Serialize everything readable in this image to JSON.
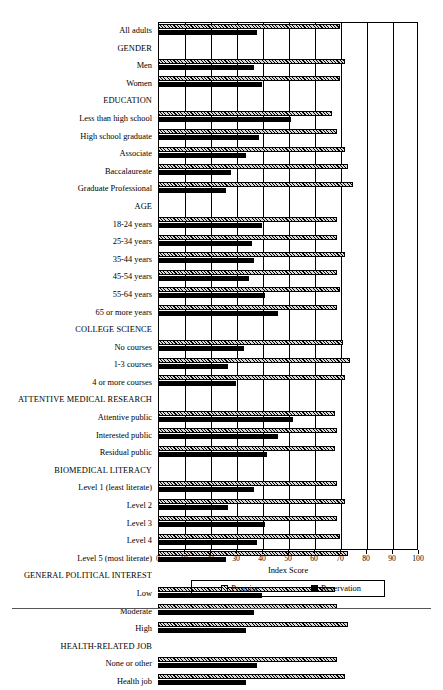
{
  "chart_data": {
    "type": "bar",
    "orientation": "horizontal",
    "title": "",
    "xlabel": "Index Score",
    "ylabel": "",
    "xlim": [
      0,
      100
    ],
    "xticks": [
      0,
      10,
      20,
      30,
      40,
      50,
      60,
      70,
      80,
      90,
      100
    ],
    "grid": "vertical",
    "legend_position": "bottom",
    "legend": [
      "Promise",
      "Reservation"
    ],
    "series": [
      {
        "name": "Promise",
        "pattern": "hatched"
      },
      {
        "name": "Reservation",
        "pattern": "solid-black"
      }
    ],
    "categories": [
      "All adults",
      "GENDER",
      "Men",
      "Women",
      "EDUCATION",
      "Less than high school",
      "High school graduate",
      "Associate",
      "Baccalaureate",
      "Graduate Professional",
      "AGE",
      "18-24 years",
      "25-34 years",
      "35-44 years",
      "45-54 years",
      "55-64 years",
      "65 or more years",
      "COLLEGE SCIENCE",
      "No courses",
      "1-3 courses",
      "4 or more courses",
      "ATTENTIVE MEDICAL RESEARCH",
      "Attentive public",
      "Interested public",
      "Residual public",
      "BIOMEDICAL LITERACY",
      "Level 1 (least literate)",
      "Level 2",
      "Level 3",
      "Level 4",
      "Level 5 (most literate)",
      "GENERAL POLITICAL INTEREST",
      "Low",
      "Moderate",
      "High",
      "HEALTH-RELATED JOB",
      "None or other",
      "Health job"
    ],
    "rows": [
      {
        "label": "All adults",
        "header": false,
        "promise": 70,
        "reservation": 38
      },
      {
        "label": "GENDER",
        "header": true,
        "promise": null,
        "reservation": null
      },
      {
        "label": "Men",
        "header": false,
        "promise": 72,
        "reservation": 37
      },
      {
        "label": "Women",
        "header": false,
        "promise": 70,
        "reservation": 40
      },
      {
        "label": "EDUCATION",
        "header": true,
        "promise": null,
        "reservation": null
      },
      {
        "label": "Less than high school",
        "header": false,
        "promise": 67,
        "reservation": 51
      },
      {
        "label": "High school graduate",
        "header": false,
        "promise": 69,
        "reservation": 39
      },
      {
        "label": "Associate",
        "header": false,
        "promise": 72,
        "reservation": 34
      },
      {
        "label": "Baccalaureate",
        "header": false,
        "promise": 73,
        "reservation": 28
      },
      {
        "label": "Graduate Professional",
        "header": false,
        "promise": 75,
        "reservation": 26
      },
      {
        "label": "AGE",
        "header": true,
        "promise": null,
        "reservation": null
      },
      {
        "label": "18-24 years",
        "header": false,
        "promise": 69,
        "reservation": 40
      },
      {
        "label": "25-34 years",
        "header": false,
        "promise": 69,
        "reservation": 36
      },
      {
        "label": "35-44 years",
        "header": false,
        "promise": 72,
        "reservation": 37
      },
      {
        "label": "45-54 years",
        "header": false,
        "promise": 69,
        "reservation": 35
      },
      {
        "label": "55-64 years",
        "header": false,
        "promise": 70,
        "reservation": 41
      },
      {
        "label": "65 or more years",
        "header": false,
        "promise": 69,
        "reservation": 46
      },
      {
        "label": "COLLEGE SCIENCE",
        "header": true,
        "promise": null,
        "reservation": null
      },
      {
        "label": "No courses",
        "header": false,
        "promise": 71,
        "reservation": 33
      },
      {
        "label": "1-3 courses",
        "header": false,
        "promise": 74,
        "reservation": 27
      },
      {
        "label": "4 or more courses",
        "header": false,
        "promise": 72,
        "reservation": 30
      },
      {
        "label": "ATTENTIVE MEDICAL RESEARCH",
        "header": true,
        "promise": null,
        "reservation": null
      },
      {
        "label": "Attentive public",
        "header": false,
        "promise": 68,
        "reservation": 52
      },
      {
        "label": "Interested public",
        "header": false,
        "promise": 69,
        "reservation": 46
      },
      {
        "label": "Residual public",
        "header": false,
        "promise": 68,
        "reservation": 42
      },
      {
        "label": "BIOMEDICAL LITERACY",
        "header": true,
        "promise": null,
        "reservation": null
      },
      {
        "label": "Level 1 (least literate)",
        "header": false,
        "promise": 69,
        "reservation": 37
      },
      {
        "label": "Level 2",
        "header": false,
        "promise": 72,
        "reservation": 27
      },
      {
        "label": "Level 3",
        "header": false,
        "promise": 69,
        "reservation": 41
      },
      {
        "label": "Level 4",
        "header": false,
        "promise": 70,
        "reservation": 38
      },
      {
        "label": "Level 5 (most literate)",
        "header": false,
        "promise": 73,
        "reservation": 26
      },
      {
        "label": "GENERAL POLITICAL INTEREST",
        "header": true,
        "promise": null,
        "reservation": null
      },
      {
        "label": "Low",
        "header": false,
        "promise": 68,
        "reservation": 40
      },
      {
        "label": "Moderate",
        "header": false,
        "promise": 69,
        "reservation": 37
      },
      {
        "label": "High",
        "header": false,
        "promise": 73,
        "reservation": 34
      },
      {
        "label": "HEALTH-RELATED JOB",
        "header": true,
        "promise": null,
        "reservation": null
      },
      {
        "label": "None or other",
        "header": false,
        "promise": 69,
        "reservation": 38
      },
      {
        "label": "Health job",
        "header": false,
        "promise": 72,
        "reservation": 34
      }
    ]
  },
  "axis": {
    "title": "Index Score",
    "ticks": [
      "0",
      "10",
      "20",
      "30",
      "40",
      "50",
      "60",
      "70",
      "80",
      "90",
      "100"
    ]
  },
  "legend": {
    "promise_label": "Promise",
    "reservation_label": "Reservation"
  },
  "colors": {
    "promise_fill": "#d8d8d8",
    "reservation_fill": "#000000",
    "axis": "#000000",
    "background": "#ffffff"
  }
}
